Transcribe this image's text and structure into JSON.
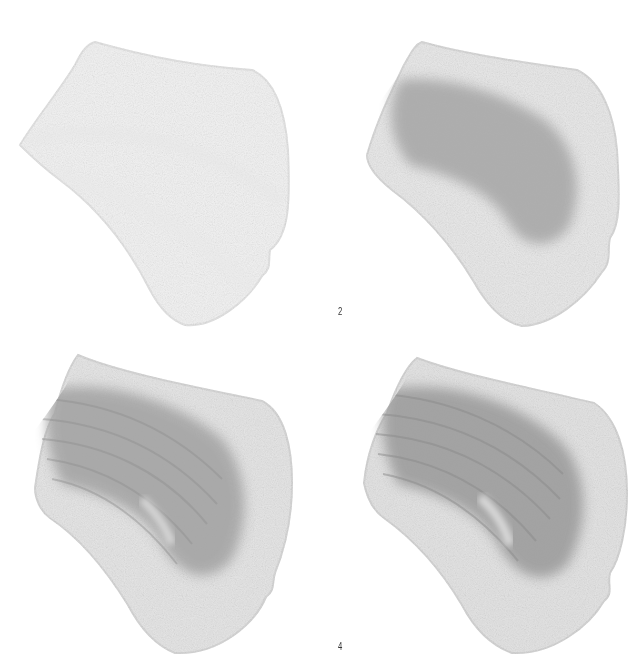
{
  "figure": {
    "panels": [
      {
        "step": 1,
        "label": "",
        "shading": "light outline fill",
        "base_tone": "#f3f3f3",
        "shadow_tone": "#ececec",
        "shadow_opacity": 0.0
      },
      {
        "step": 2,
        "label": "2",
        "shading": "mid-tone core shadow added",
        "base_tone": "#e6e6e6",
        "shadow_tone": "#a9a9a9",
        "shadow_opacity": 0.85
      },
      {
        "step": 3,
        "label": "",
        "shading": "directional strokes and darker core",
        "base_tone": "#e2e2e2",
        "shadow_tone": "#a3a3a3",
        "shadow_opacity": 0.9
      },
      {
        "step": 4,
        "label": "4",
        "shading": "refined strokes with highlights",
        "base_tone": "#e0e0e0",
        "shadow_tone": "#9e9e9e",
        "shadow_opacity": 0.95
      }
    ]
  },
  "labels": {
    "step2": "2",
    "step4": "4"
  },
  "colors": {
    "background": "#ffffff",
    "label": "#333333"
  }
}
